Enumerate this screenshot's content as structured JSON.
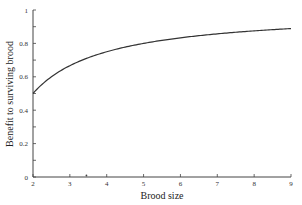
{
  "chart_data": {
    "type": "line",
    "title": "",
    "xlabel": "Brood size",
    "ylabel": "Benefit to surviving brood",
    "xlim": [
      2,
      9
    ],
    "ylim": [
      0,
      1
    ],
    "x_ticks": [
      "2",
      "3",
      "4",
      "5",
      "6",
      "7",
      "8",
      "9"
    ],
    "y_ticks": [
      "0",
      "0.2",
      "0.4",
      "0.6",
      "0.8",
      "1"
    ],
    "y_minor_step": 0.1,
    "grid": false,
    "legend": null,
    "series": [
      {
        "name": "benefit",
        "formula": "1 - 1/n",
        "x": [
          2,
          2.5,
          3,
          3.5,
          4,
          4.5,
          5,
          5.5,
          6,
          6.5,
          7,
          7.5,
          8,
          8.5,
          9
        ],
        "y": [
          0.5,
          0.6,
          0.667,
          0.714,
          0.75,
          0.778,
          0.8,
          0.818,
          0.833,
          0.846,
          0.857,
          0.867,
          0.875,
          0.882,
          0.889
        ]
      }
    ],
    "annotations": [
      {
        "type": "axis-marker",
        "x": 3.45,
        "description": "small dot mark on x-axis"
      }
    ],
    "colors": {
      "line": "#333333",
      "axis": "#444444"
    }
  }
}
